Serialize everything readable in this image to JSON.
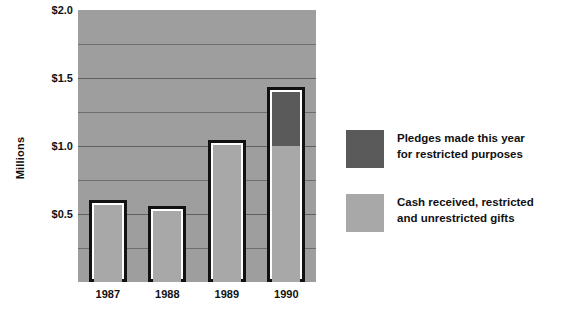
{
  "chart_data": {
    "type": "bar",
    "title": "",
    "xlabel": "",
    "ylabel": "Millions",
    "categories": [
      "1987",
      "1988",
      "1989",
      "1990"
    ],
    "ylim": [
      0,
      2.0
    ],
    "ytick_labels": [
      "$0.5",
      "$1.0",
      "$1.5",
      "$2.0"
    ],
    "ytick_values": [
      0.5,
      1.0,
      1.5,
      2.0
    ],
    "gridlines": [
      0.25,
      0.5,
      0.75,
      1.0,
      1.25,
      1.5,
      1.75
    ],
    "grid": true,
    "stacked": true,
    "legend_position": "right",
    "series": [
      {
        "name": "Cash received, restricted and unrestricted gifts",
        "color": "#a8a8a8",
        "values": [
          0.57,
          0.52,
          1.01,
          1.0
        ]
      },
      {
        "name": "Pledges made this year for restricted purposes",
        "color": "#5a5a5a",
        "values": [
          0,
          0,
          0,
          0.4
        ]
      }
    ],
    "totals": [
      0.57,
      0.52,
      1.01,
      1.4
    ]
  },
  "axis": {
    "y_label": "Millions",
    "y_ticks": [
      {
        "label": "$2.0",
        "value": 2.0
      },
      {
        "label": "$1.5",
        "value": 1.5
      },
      {
        "label": "$1.0",
        "value": 1.0
      },
      {
        "label": "$0.5",
        "value": 0.5
      }
    ],
    "x_ticks": [
      {
        "label": "1987"
      },
      {
        "label": "1988"
      },
      {
        "label": "1989"
      },
      {
        "label": "1990"
      }
    ]
  },
  "legend": {
    "items": [
      {
        "swatch": "pledge",
        "color": "#5a5a5a",
        "line1": "Pledges made this year",
        "line2": "for restricted purposes"
      },
      {
        "swatch": "cash",
        "color": "#a8a8a8",
        "line1": "Cash received, restricted",
        "line2": "and unrestricted gifts"
      }
    ]
  },
  "colors": {
    "plot_background": "#9e9e9e",
    "gridline": "#6e6e6e",
    "bar_outline": "#111111",
    "bar_inner_gap": "#ffffff",
    "cash_fill": "#a8a8a8",
    "pledge_fill": "#5a5a5a",
    "page_background": "#ffffff",
    "text": "#111111"
  }
}
